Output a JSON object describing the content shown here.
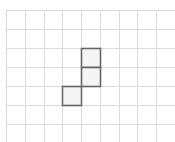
{
  "diagram": {
    "type": "grid-with-highlighted-cells",
    "grid": {
      "columns": 9,
      "rows": 7,
      "origin_x": 6,
      "origin_y": 10,
      "cell_width": 18.75,
      "cell_height": 19,
      "line_color": "#dcdcdc",
      "open_right": true,
      "open_bottom": true
    },
    "shape": {
      "description": "Three connected squares forming an L/S-like polyomino",
      "cells": [
        {
          "col": 4,
          "row": 2
        },
        {
          "col": 4,
          "row": 3
        },
        {
          "col": 3,
          "row": 4
        }
      ],
      "fill_color": "#f5f5f5",
      "stroke_color": "#666666"
    }
  }
}
